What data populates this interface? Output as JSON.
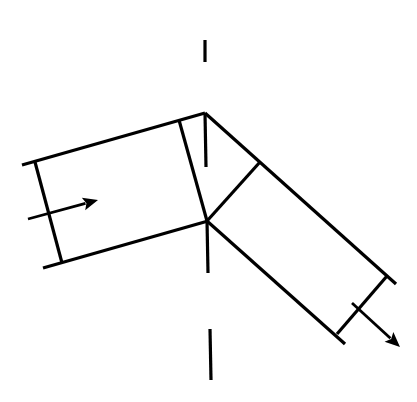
{
  "diagram": {
    "kind": "beam-reflection-line-drawing",
    "width": 417,
    "height": 402,
    "stroke_color": "#000000",
    "background": "#ffffff",
    "center_line": {
      "style": "dashed-vertical",
      "segments": [
        {
          "x1": 205,
          "y1": 40,
          "x2": 205,
          "y2": 62
        },
        {
          "x1": 205,
          "y1": 113,
          "x2": 206,
          "y2": 167
        },
        {
          "x1": 207,
          "y1": 220,
          "x2": 208,
          "y2": 273
        },
        {
          "x1": 210,
          "y1": 329,
          "x2": 211,
          "y2": 380
        }
      ]
    },
    "incident_beam": {
      "edges": [
        {
          "name": "top-edge",
          "x1": 22,
          "y1": 165,
          "x2": 205,
          "y2": 113
        },
        {
          "name": "bottom-edge",
          "x1": 43,
          "y1": 268,
          "x2": 208,
          "y2": 221
        },
        {
          "name": "left-wavefront",
          "x1": 35,
          "y1": 162,
          "x2": 62,
          "y2": 263
        },
        {
          "name": "right-wavefront",
          "x1": 179,
          "y1": 120,
          "x2": 207,
          "y2": 221
        }
      ],
      "arrow": {
        "x1": 28,
        "y1": 219,
        "x2": 98,
        "y2": 200
      }
    },
    "reflected_beam": {
      "edges": [
        {
          "name": "top-edge",
          "x1": 205,
          "y1": 113,
          "x2": 396,
          "y2": 284
        },
        {
          "name": "bottom-edge",
          "x1": 207,
          "y1": 221,
          "x2": 345,
          "y2": 344
        },
        {
          "name": "left-wavefront",
          "x1": 260,
          "y1": 162,
          "x2": 207,
          "y2": 221
        },
        {
          "name": "right-wavefront",
          "x1": 387,
          "y1": 276,
          "x2": 337,
          "y2": 334
        }
      ],
      "arrow": {
        "x1": 352,
        "y1": 303,
        "x2": 400,
        "y2": 347
      }
    }
  }
}
